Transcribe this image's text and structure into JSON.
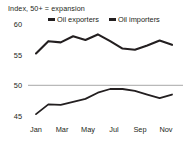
{
  "chart_data": {
    "type": "line",
    "title": "Index, 50+ = expansion",
    "xlabel": "",
    "ylabel": "",
    "ylim": [
      44,
      60.5
    ],
    "yticks": [
      60,
      55,
      50,
      45
    ],
    "grid": "single reference line at 50",
    "reference_line": 50,
    "legend_position": "top-center",
    "x": [
      "Jan",
      "Feb",
      "Mar",
      "Apr",
      "May",
      "Jun",
      "Jul",
      "Aug",
      "Sep",
      "Oct",
      "Nov",
      "Dec"
    ],
    "xticks": [
      "Jan",
      "Mar",
      "May",
      "Jul",
      "Sep",
      "Nov"
    ],
    "series": [
      {
        "name": "Oil exporters",
        "color": "#231f20",
        "values": [
          55.2,
          57.2,
          57.0,
          58.0,
          57.4,
          58.3,
          57.2,
          56.0,
          55.8,
          56.5,
          57.3,
          56.6
        ]
      },
      {
        "name": "Oil importers",
        "color": "#231f20",
        "values": [
          45.3,
          46.9,
          46.8,
          47.3,
          47.8,
          48.8,
          49.4,
          49.4,
          49.1,
          48.5,
          47.9,
          48.5
        ]
      }
    ]
  },
  "axis_title": "Index, 50+ = expansion",
  "yticks": [
    {
      "label": "60"
    },
    {
      "label": "55"
    },
    {
      "label": "50"
    },
    {
      "label": "45"
    }
  ],
  "xticks": [
    {
      "label": "Jan"
    },
    {
      "label": "Mar"
    },
    {
      "label": "May"
    },
    {
      "label": "Jul"
    },
    {
      "label": "Sep"
    },
    {
      "label": "Nov"
    }
  ],
  "legend": [
    {
      "label": "Oil exporters"
    },
    {
      "label": "Oil importers"
    }
  ]
}
